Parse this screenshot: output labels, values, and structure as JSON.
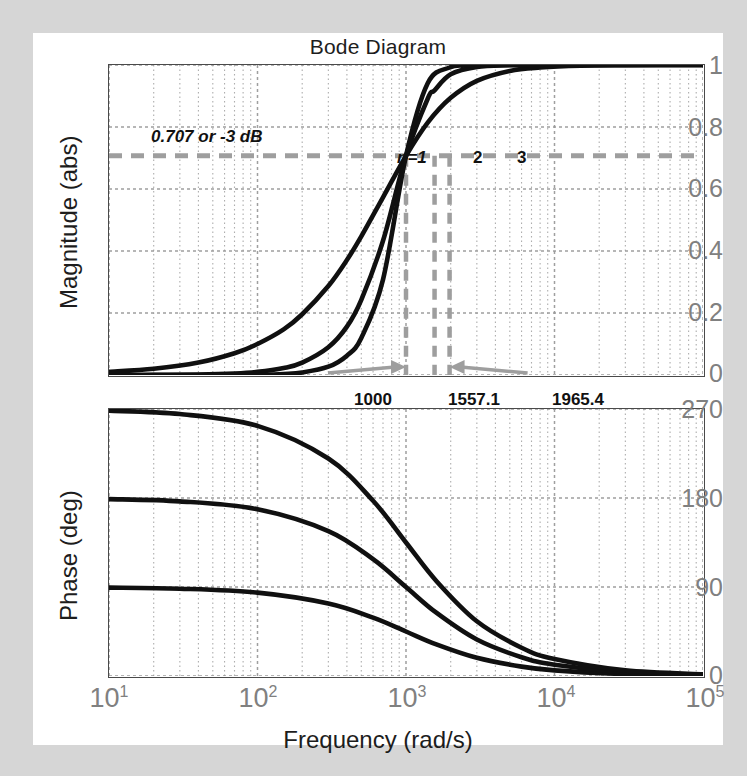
{
  "figure": {
    "title": "Bode Diagram",
    "background": "#d6d6d6",
    "plot_background": "#ffffff",
    "axis_color": "#4a4a4a",
    "grid_color": "#9a9a9a",
    "curve_color": "#101010",
    "annotation_color": "#9e9e9e",
    "tick_label_color": "#808080"
  },
  "xaxis": {
    "label": "Frequency  (rad/s)",
    "ticks": [
      "10",
      "10",
      "10",
      "10",
      "10"
    ],
    "exponents": [
      "1",
      "2",
      "3",
      "4",
      "5"
    ],
    "decade_min": 1,
    "decade_max": 5,
    "scale": "log"
  },
  "magnitude": {
    "ylabel": "Magnitude (abs)",
    "yticks": [
      "1",
      "0.8",
      "0.6",
      "0.4",
      "0.2",
      "0"
    ],
    "ylim": [
      0,
      1
    ],
    "cutoff_note": "0.707 or -3 dB",
    "cutoff_level": 0.707,
    "curve_tags": [
      "n=1",
      "2",
      "3"
    ],
    "freq_tags": [
      "1000",
      "1557.1",
      "1965.4"
    ]
  },
  "phase": {
    "ylabel": "Phase (deg)",
    "yticks": [
      "270",
      "180",
      "90",
      "0"
    ],
    "ylim": [
      0,
      270
    ]
  },
  "chart_data": {
    "type": "line",
    "title": "Bode Diagram",
    "xlabel": "Frequency  (rad/s)",
    "xscale": "log",
    "xlim": [
      10,
      100000
    ],
    "xticks": [
      10,
      100,
      1000,
      10000,
      100000
    ],
    "grid": true,
    "legend": "inline curve labels n=1, 2, 3",
    "subplots": [
      {
        "name": "magnitude",
        "ylabel": "Magnitude (abs)",
        "ylim": [
          0,
          1
        ],
        "yticks": [
          0,
          0.2,
          0.4,
          0.6,
          0.8,
          1
        ],
        "annotations": [
          {
            "text": "0.707 or -3 dB",
            "type": "text",
            "x": 60,
            "y": 0.8
          },
          {
            "text": "n=1",
            "type": "curve-label",
            "x": 1000,
            "y": 0.83
          },
          {
            "text": "2",
            "type": "curve-label",
            "x": 1560,
            "y": 0.83
          },
          {
            "text": "3",
            "type": "curve-label",
            "x": 2600,
            "y": 0.83
          },
          {
            "text": "0.707",
            "type": "hline",
            "y": 0.707
          },
          {
            "text": "1000",
            "type": "vline-arrow",
            "x": 1000
          },
          {
            "text": "1557.1",
            "type": "vline-arrow",
            "x": 1557.1
          },
          {
            "text": "1965.4",
            "type": "vline-arrow",
            "x": 1965.4
          }
        ],
        "series": [
          {
            "name": "n=1",
            "x": [
              10,
              20,
              40,
              70,
              100,
              150,
              200,
              300,
              400,
              500,
              700,
              1000,
              1400,
              2000,
              3000,
              5000,
              8000,
              15000,
              30000,
              100000
            ],
            "y": [
              0.01,
              0.02,
              0.04,
              0.07,
              0.1,
              0.147,
              0.196,
              0.287,
              0.371,
              0.447,
              0.573,
              0.707,
              0.814,
              0.894,
              0.949,
              0.981,
              0.992,
              0.998,
              0.9995,
              1.0
            ]
          },
          {
            "name": "n=2",
            "x": [
              10,
              20,
              40,
              70,
              100,
              150,
              200,
              300,
              400,
              500,
              700,
              1000,
              1400,
              1557.1,
              2000,
              3000,
              5000,
              8000,
              15000,
              30000,
              100000
            ],
            "y": [
              0.0001,
              0.0004,
              0.0016,
              0.0049,
              0.01,
              0.0225,
              0.04,
              0.0896,
              0.156,
              0.2425,
              0.4329,
              0.7071,
              0.8912,
              0.9183,
              0.9701,
              0.9939,
              0.9992,
              0.9999,
              1.0,
              1.0,
              1.0
            ]
          },
          {
            "name": "n=3",
            "x": [
              10,
              20,
              40,
              70,
              100,
              150,
              200,
              300,
              400,
              500,
              700,
              1000,
              1400,
              1965.4,
              2500,
              3000,
              5000,
              8000,
              15000,
              30000,
              100000
            ],
            "y": [
              1e-06,
              8e-06,
              6.4e-05,
              0.00034,
              0.001,
              0.0034,
              0.008,
              0.0267,
              0.0624,
              0.1195,
              0.3076,
              0.7071,
              0.9413,
              0.9918,
              0.9983,
              0.9993,
              0.99994,
              1.0,
              1.0,
              1.0,
              1.0
            ]
          }
        ]
      },
      {
        "name": "phase",
        "ylabel": "Phase (deg)",
        "ylim": [
          0,
          270
        ],
        "yticks": [
          0,
          90,
          180,
          270
        ],
        "series": [
          {
            "name": "n=1",
            "x": [
              10,
              30,
              100,
              300,
              600,
              1000,
              1600,
              3000,
              6000,
              10000,
              30000,
              100000
            ],
            "y": [
              89.4,
              88.3,
              84.3,
              73.3,
              59.0,
              45.0,
              32.0,
              18.4,
              9.5,
              5.7,
              1.9,
              0.6
            ]
          },
          {
            "name": "n=2",
            "x": [
              10,
              30,
              100,
              300,
              600,
              1000,
              1600,
              3000,
              6000,
              10000,
              30000,
              100000
            ],
            "y": [
              178.9,
              176.6,
              168.6,
              146.6,
              118.1,
              90.0,
              64.0,
              36.9,
              19.0,
              11.4,
              3.8,
              1.1
            ]
          },
          {
            "name": "n=3",
            "x": [
              10,
              30,
              100,
              300,
              600,
              1000,
              1600,
              3000,
              6000,
              10000,
              30000,
              100000
            ],
            "y": [
              268.3,
              264.9,
              252.9,
              219.9,
              177.2,
              135.0,
              96.1,
              55.3,
              28.6,
              17.2,
              5.7,
              1.7
            ]
          }
        ]
      }
    ]
  }
}
